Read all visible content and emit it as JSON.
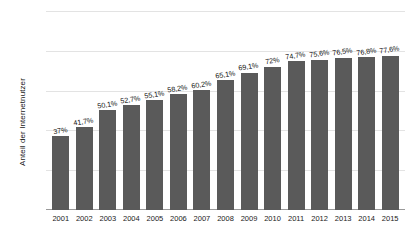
{
  "chart_data": {
    "type": "bar",
    "title": "",
    "subtitle": "",
    "xlabel": "",
    "ylabel": "Anteil der Internetnutzer",
    "categories": [
      "2001",
      "2002",
      "2003",
      "2004",
      "2005",
      "2006",
      "2007",
      "2008",
      "2009",
      "2010",
      "2011",
      "2012",
      "2013",
      "2014",
      "2015"
    ],
    "values": [
      37,
      41.7,
      50.1,
      52.7,
      55.1,
      58.2,
      60.2,
      65.1,
      69.1,
      72,
      74.7,
      75.6,
      76.5,
      76.8,
      77.6
    ],
    "value_labels": [
      "37%",
      "41,7%",
      "50,1%",
      "52,7%",
      "55,1%",
      "58,2%",
      "60,2%",
      "65,1%",
      "69,1%",
      "72%",
      "74,7%",
      "75,6%",
      "76,5%",
      "76,8%",
      "77,6%"
    ],
    "ylim": [
      0,
      100
    ],
    "ytick_values": [
      0,
      20,
      40,
      60,
      80,
      100
    ],
    "ytick_labels": [
      "0%",
      "20%",
      "40%",
      "60%",
      "80%",
      "100%"
    ],
    "grid": true,
    "grid_axis": "y",
    "legend": false,
    "legend_position": "none",
    "bar_color": "#5a5a5a",
    "gridline_color": "#e3e3e3",
    "axis_color": "#9a9a9a",
    "text_color": "#1a1a1a",
    "background_color": "#ffffff"
  }
}
